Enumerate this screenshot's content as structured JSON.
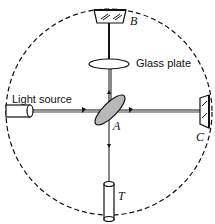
{
  "diagram": {
    "labels": {
      "mirror_b": "B",
      "glass_plate": "Glass plate",
      "light_source": "Light source",
      "splitter_a": "A",
      "mirror_c": "C",
      "telescope_t": "T"
    },
    "colors": {
      "stroke": "#111111",
      "splitter_fill": "#b8b8b8",
      "background": "#ffffff"
    },
    "components": [
      {
        "id": "B",
        "type": "mirror"
      },
      {
        "id": "glass-plate",
        "type": "compensating plate"
      },
      {
        "id": "light-source",
        "type": "source"
      },
      {
        "id": "A",
        "type": "beam splitter"
      },
      {
        "id": "C",
        "type": "mirror"
      },
      {
        "id": "T",
        "type": "telescope"
      }
    ]
  }
}
